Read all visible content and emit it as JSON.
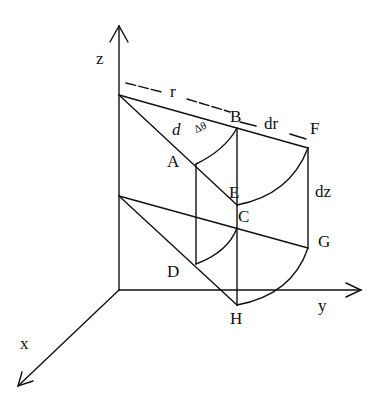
{
  "diagram": {
    "type": "cylindrical volume element",
    "colors": {
      "stroke": "#111111",
      "background": "#ffffff"
    },
    "axes": {
      "z": {
        "label": "z"
      },
      "y": {
        "label": "y"
      },
      "x": {
        "label": "x"
      }
    },
    "points": {
      "A": "A",
      "B": "B",
      "C": "C",
      "D": "D",
      "E": "E",
      "F": "F",
      "G": "G",
      "H": "H"
    },
    "dimensions": {
      "r": "r",
      "dr": "dr",
      "dz": "dz",
      "d": "d",
      "dtheta": "Δθ"
    }
  }
}
